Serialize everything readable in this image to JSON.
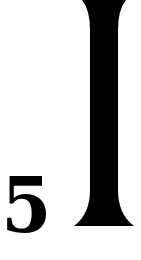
{
  "digit": "5",
  "bar_glyph": "I",
  "colors": {
    "ink": "#000000",
    "background": "#ffffff"
  }
}
